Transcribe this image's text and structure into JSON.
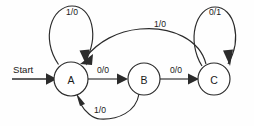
{
  "diagram": {
    "type": "finite-state-machine",
    "background_color": "#fefefe",
    "stroke_color": "#2b2b2b",
    "start_label": "Start",
    "states": [
      {
        "id": "A",
        "label": "A",
        "cx": 71,
        "cy": 79,
        "r": 17
      },
      {
        "id": "B",
        "label": "B",
        "cx": 144,
        "cy": 79,
        "r": 16
      },
      {
        "id": "C",
        "label": "C",
        "cx": 214,
        "cy": 79,
        "r": 16
      }
    ],
    "transitions": [
      {
        "id": "a-self",
        "from": "A",
        "to": "A",
        "label": "1/0",
        "label_x": 72,
        "label_y": 12
      },
      {
        "id": "a-to-b",
        "from": "A",
        "to": "B",
        "label": "0/0",
        "label_x": 103,
        "label_y": 70
      },
      {
        "id": "b-to-c",
        "from": "B",
        "to": "C",
        "label": "0/0",
        "label_x": 176,
        "label_y": 70
      },
      {
        "id": "c-self",
        "from": "C",
        "to": "C",
        "label": "0/1",
        "label_x": 215,
        "label_y": 12
      },
      {
        "id": "c-to-a",
        "from": "C",
        "to": "A",
        "label": "1/0",
        "label_x": 160,
        "label_y": 24
      },
      {
        "id": "b-to-a",
        "from": "B",
        "to": "A",
        "label": "1/0",
        "label_x": 100,
        "label_y": 110
      }
    ]
  }
}
